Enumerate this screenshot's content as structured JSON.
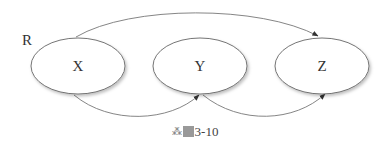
{
  "diagram": {
    "side_label": "R",
    "nodes": [
      {
        "id": "X",
        "label": "X",
        "cx": 78,
        "cy": 66,
        "rx": 47,
        "ry": 28
      },
      {
        "id": "Y",
        "label": "Y",
        "cx": 200,
        "cy": 66,
        "rx": 47,
        "ry": 28
      },
      {
        "id": "Z",
        "label": "Z",
        "cx": 322,
        "cy": 66,
        "rx": 47,
        "ry": 28
      }
    ],
    "edges": [
      {
        "from": "X",
        "to": "Z",
        "route": "top"
      },
      {
        "from": "X",
        "to": "Y",
        "route": "bottom"
      },
      {
        "from": "Y",
        "to": "Z",
        "route": "bottom"
      }
    ],
    "colors": {
      "stroke": "#666666",
      "fill": "#ffffff",
      "text": "#333333"
    }
  },
  "caption": {
    "icon": "figure-icon",
    "prefix": "图",
    "number": "3-10"
  }
}
